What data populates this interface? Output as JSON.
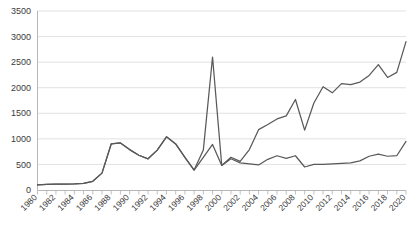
{
  "chart_data": {
    "type": "line",
    "title": "",
    "subtitle": "",
    "xlabel": "",
    "ylabel": "",
    "ylim": [
      0,
      3500
    ],
    "ytick_step": 500,
    "ytick_labels": [
      "0",
      "500",
      "1000",
      "1500",
      "2000",
      "2500",
      "3000",
      "3500"
    ],
    "grid": true,
    "legend_position": "top-right-cropped",
    "xtick_labels": [
      "1980",
      "1982",
      "1984",
      "1986",
      "1988",
      "1990",
      "1992",
      "1994",
      "1996",
      "1998",
      "2000",
      "2002",
      "2004",
      "2006",
      "2008",
      "2010",
      "2012",
      "2014",
      "2016",
      "2018",
      "2020"
    ],
    "xtick_label_rotation": -45,
    "xtick_every": 2,
    "minor_ticks_every": 1,
    "x": [
      1980,
      1981,
      1982,
      1983,
      1984,
      1985,
      1986,
      1987,
      1988,
      1989,
      1990,
      1991,
      1992,
      1993,
      1994,
      1995,
      1996,
      1997,
      1998,
      1999,
      2000,
      2001,
      2002,
      2003,
      2004,
      2005,
      2006,
      2007,
      2008,
      2009,
      2010,
      2011,
      2012,
      2013,
      2014,
      2015,
      2016,
      2017,
      2018,
      2019,
      2020
    ],
    "series": [
      {
        "name": "Series 1",
        "color": "#595959",
        "values": [
          100,
          110,
          115,
          115,
          120,
          130,
          170,
          330,
          900,
          920,
          790,
          680,
          610,
          780,
          1040,
          900,
          640,
          390,
          780,
          2600,
          480,
          640,
          560,
          790,
          1180,
          1280,
          1390,
          1450,
          1770,
          1170,
          1700,
          2020,
          1900,
          2080,
          2060,
          2110,
          2240,
          2450,
          2200,
          2300,
          2900
        ]
      },
      {
        "name": "Series 2",
        "color": "#595959",
        "values": [
          100,
          110,
          115,
          115,
          120,
          130,
          170,
          330,
          900,
          920,
          790,
          680,
          610,
          780,
          1040,
          900,
          640,
          390,
          640,
          890,
          480,
          610,
          530,
          510,
          490,
          600,
          670,
          620,
          670,
          450,
          500,
          500,
          510,
          520,
          530,
          570,
          660,
          700,
          660,
          670,
          950
        ]
      }
    ]
  }
}
